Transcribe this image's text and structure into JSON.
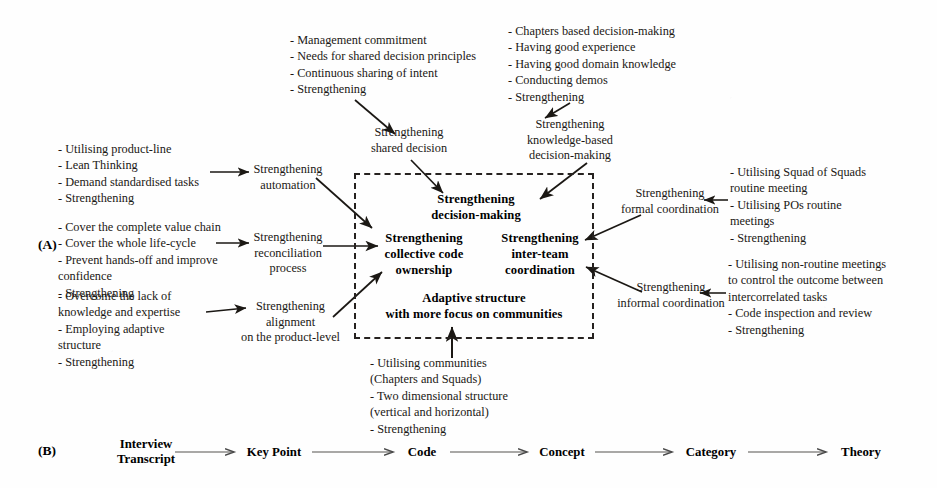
{
  "figure": {
    "panel_a_label": "(A)",
    "panel_b_label": "(B)"
  },
  "panel_a": {
    "left_inputs": [
      {
        "id": "left-input-product-line",
        "text": "- Utilising product-line\n- Lean Thinking\n- Demand standardised tasks\n- Strengthening"
      },
      {
        "id": "left-input-value-chain",
        "text": "- Cover the complete value chain\n- Cover the whole life-cycle\n- Prevent hands-off and improve\n  confidence\n- Strengthening"
      },
      {
        "id": "left-input-knowledge-gap",
        "text": "- Overcome the lack of\n  knowledge and expertise\n- Employing adaptive structure\n- Strengthening"
      }
    ],
    "top_inputs": [
      {
        "id": "top-input-shared-decision",
        "text": "- Management commitment\n- Needs for shared decision principles\n- Continuous sharing of intent\n- Strengthening"
      },
      {
        "id": "top-input-knowledge-based",
        "text": "- Chapters based decision-making\n- Having good experience\n- Having good domain knowledge\n- Conducting demos\n- Strengthening"
      }
    ],
    "right_inputs": [
      {
        "id": "right-input-formal",
        "text": "- Utilising Squad of Squads\n  routine meeting\n- Utilising POs routine\n  meetings\n- Strengthening"
      },
      {
        "id": "right-input-informal",
        "text": "- Utilising non-routine meetings\n  to control the outcome between\n  intercorrelated tasks\n- Code inspection and review\n- Strengthening"
      }
    ],
    "bottom_inputs": [
      {
        "id": "bottom-input-communities",
        "text": "- Utilising communities\n  (Chapters and Squads)\n- Two dimensional structure\n(vertical and horizontal)\n- Strengthening"
      }
    ],
    "intermediate_nodes": [
      {
        "id": "node-automation",
        "text": "Strengthening\nautomation"
      },
      {
        "id": "node-reconciliation",
        "text": "Strengthening\nreconciliation\nprocess"
      },
      {
        "id": "node-alignment",
        "text": "Strengthening\nalignment\non the product-level"
      },
      {
        "id": "node-shared-decision",
        "text": "Strengthening\nshared decision"
      },
      {
        "id": "node-knowledge-based",
        "text": "Strengthening\nknowledge-based\ndecision-making"
      },
      {
        "id": "node-formal-coordination",
        "text": "Strengthening\nformal coordination"
      },
      {
        "id": "node-informal-coordination",
        "text": "Strengthening\ninformal coordination"
      }
    ],
    "core_box_items": [
      {
        "id": "core-decision-making",
        "text": "Strengthening\ndecision-making"
      },
      {
        "id": "core-collective-code-ownership",
        "text": "Strengthening\ncollective code\nownership"
      },
      {
        "id": "core-inter-team-coordination",
        "text": "Strengthening\ninter-team\ncoordination"
      },
      {
        "id": "core-adaptive-structure",
        "text": "Adaptive structure\nwith more focus on communities"
      }
    ]
  },
  "panel_b": {
    "chain": [
      {
        "id": "chain-interview-transcript",
        "label": "Interview\nTranscript"
      },
      {
        "id": "chain-key-point",
        "label": "Key Point"
      },
      {
        "id": "chain-code",
        "label": "Code"
      },
      {
        "id": "chain-concept",
        "label": "Concept"
      },
      {
        "id": "chain-category",
        "label": "Category"
      },
      {
        "id": "chain-theory",
        "label": "Theory"
      }
    ]
  },
  "colors": {
    "ink": "#1b1814",
    "box_border": "#262220",
    "paper": "#fefefe"
  }
}
